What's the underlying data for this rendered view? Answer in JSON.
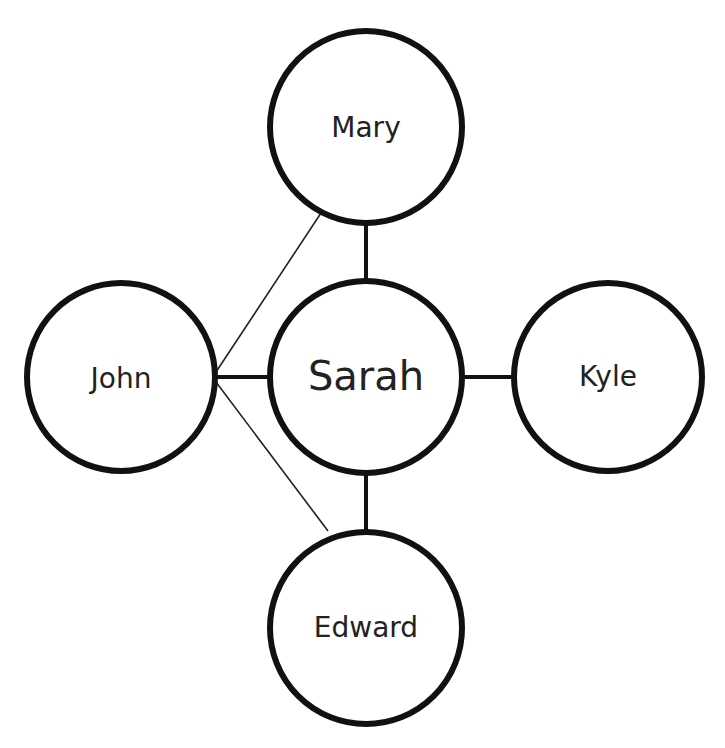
{
  "diagram": {
    "type": "network",
    "nodes": [
      {
        "id": "mary",
        "label": "Mary",
        "cx": 366,
        "cy": 127,
        "r": 96,
        "font_size": 28
      },
      {
        "id": "john",
        "label": "John",
        "cx": 121,
        "cy": 377,
        "r": 94,
        "font_size": 28
      },
      {
        "id": "sarah",
        "label": "Sarah",
        "cx": 366,
        "cy": 377,
        "r": 96,
        "font_size": 40
      },
      {
        "id": "kyle",
        "label": "Kyle",
        "cx": 608,
        "cy": 377,
        "r": 94,
        "font_size": 28
      },
      {
        "id": "edward",
        "label": "Edward",
        "cx": 366,
        "cy": 628,
        "r": 96,
        "font_size": 28
      }
    ],
    "edges": [
      {
        "from": "sarah",
        "to": "mary",
        "style": "thick"
      },
      {
        "from": "sarah",
        "to": "edward",
        "style": "thick"
      },
      {
        "from": "sarah",
        "to": "john",
        "style": "thick"
      },
      {
        "from": "sarah",
        "to": "kyle",
        "style": "thick"
      },
      {
        "from": "john",
        "to": "mary",
        "style": "thin"
      },
      {
        "from": "john",
        "to": "edward",
        "style": "thin"
      }
    ],
    "colors": {
      "stroke": "#111111",
      "fill": "#ffffff",
      "text": "#222222"
    }
  }
}
